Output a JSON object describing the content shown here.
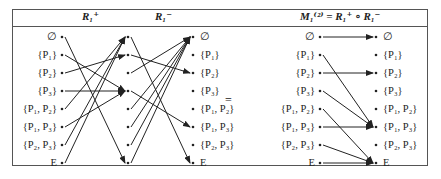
{
  "headers": {
    "r_plus": "R₁⁺",
    "r_minus": "R₁⁻",
    "m": "M₁⁽²⁾ = R₁⁺ ∘ R₁⁻"
  },
  "equals_sign": "=",
  "nodes": [
    "∅",
    "{P₁}",
    "{P₂}",
    "{P₃}",
    "{P₁, P₂}",
    "{P₁, P₃}",
    "{P₂, P₃}",
    "E"
  ],
  "left_labels": [
    "∅",
    "{P₁}",
    "{P₂}",
    "{P₃}",
    "{P₁, P₂}",
    "{P₁, P₃}",
    "{P₂, P₃}",
    "E"
  ],
  "mid_labels": [
    "∅",
    "{P₁}",
    "{P₂}",
    "{P₃}",
    "{P₁, P₂}",
    "{P₁, P₃}",
    "{P₂, P₃}",
    "E"
  ],
  "m_left_labels": [
    "∅",
    "{P₁}",
    "{P₂}",
    "{P₃}",
    "{P₁, P₂}",
    "{P₁, P₃}",
    "{P₂, P₃}",
    "E"
  ],
  "m_right_labels": [
    "∅",
    "{P₁}",
    "{P₂}",
    "{P₃}",
    "{P₁, P₂}",
    "{P₁, P₃}",
    "{P₂, P₃}",
    "E"
  ],
  "relations": {
    "r_plus": [
      [
        0,
        7
      ],
      [
        1,
        3
      ],
      [
        2,
        1
      ],
      [
        3,
        3
      ],
      [
        4,
        0
      ],
      [
        5,
        3
      ],
      [
        6,
        0
      ],
      [
        7,
        0
      ]
    ],
    "r_minus": [
      [
        0,
        7
      ],
      [
        1,
        2
      ],
      [
        2,
        0
      ],
      [
        3,
        5
      ],
      [
        4,
        0
      ],
      [
        5,
        0
      ],
      [
        6,
        0
      ],
      [
        7,
        0
      ]
    ],
    "m": [
      [
        0,
        0
      ],
      [
        1,
        5
      ],
      [
        2,
        2
      ],
      [
        3,
        5
      ],
      [
        4,
        7
      ],
      [
        5,
        5
      ],
      [
        6,
        7
      ],
      [
        7,
        7
      ]
    ]
  },
  "colors": {
    "line": "#222222",
    "frame": "#555555"
  }
}
